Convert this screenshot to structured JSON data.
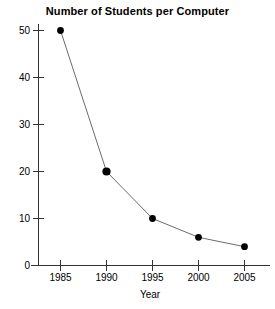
{
  "chart_data": {
    "type": "line",
    "title": "Number of Students per Computer",
    "xlabel": "Year",
    "ylabel": "",
    "categories": [
      "1985",
      "1990",
      "1995",
      "2000",
      "2005"
    ],
    "x": [
      1985,
      1990,
      1995,
      2000,
      2005
    ],
    "values": [
      50,
      20,
      10,
      6,
      4
    ],
    "series": [
      {
        "name": "Students per Computer",
        "values": [
          50,
          20,
          10,
          6,
          4
        ]
      }
    ],
    "xtick_labels": [
      "1985",
      "1990",
      "1995",
      "2000",
      "2005"
    ],
    "ytick_labels": [
      "0",
      "10",
      "20",
      "30",
      "40",
      "50"
    ],
    "ytick_values": [
      0,
      10,
      20,
      30,
      40,
      50
    ],
    "ylim": [
      0,
      52
    ],
    "xlim": [
      1983,
      2007
    ],
    "grid": false,
    "legend": false,
    "marker": "filled-circle",
    "line_color": "#6b6b6b",
    "marker_color": "#000000",
    "axis_color": "#333333",
    "background_color": "#ffffff"
  }
}
